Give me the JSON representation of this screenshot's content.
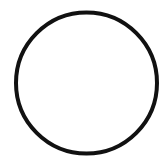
{
  "canvas": {
    "width": 164,
    "height": 162,
    "background": "#ffffff"
  },
  "shape": {
    "type": "circle",
    "cx": 86.5,
    "cy": 83,
    "r": 70.5,
    "stroke": "#111111",
    "stroke_width": 4,
    "fill": "none"
  }
}
